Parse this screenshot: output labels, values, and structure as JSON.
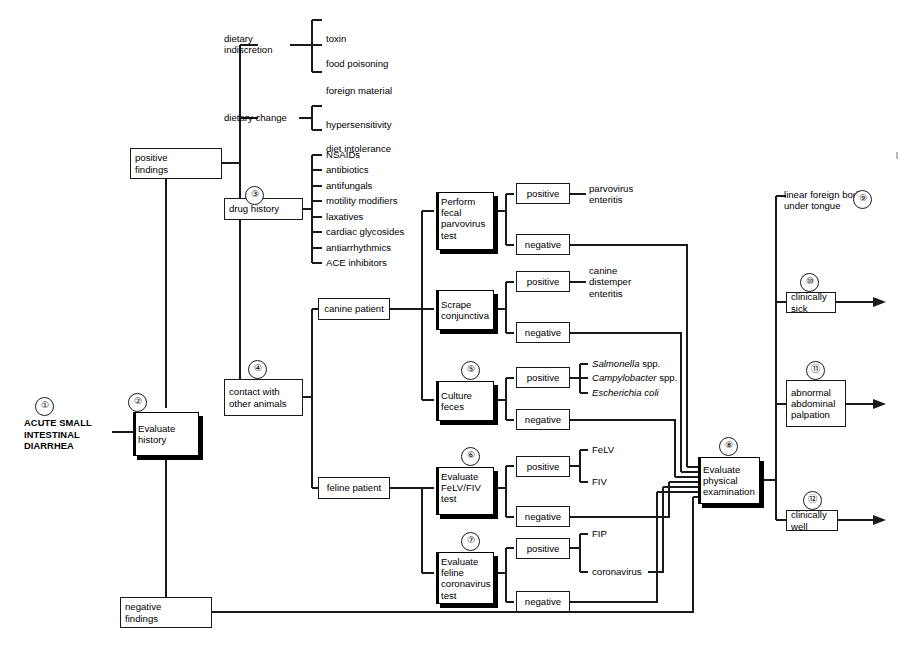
{
  "entry": {
    "label": "ACUTE SMALL\nINTESTINAL\nDIARRHEA",
    "line1": "ACUTE SMALL",
    "line2": "INTESTINAL",
    "line3": "DIARRHEA",
    "number": "①"
  },
  "nodes": {
    "evaluate_history": {
      "label": "Evaluate\nhistory",
      "number": "②"
    },
    "positive_findings": {
      "label": "positive\nfindings"
    },
    "negative_findings": {
      "label": "negative\nfindings"
    },
    "dietary_indiscretion": {
      "label": "dietary\nindiscretion"
    },
    "dietary_change": {
      "label": "dietary change"
    },
    "drug_history": {
      "label": "drug history",
      "number": "③"
    },
    "contact_other_animals": {
      "label": "contact with\nother animals",
      "number": "④"
    },
    "canine_patient": {
      "label": "canine patient"
    },
    "feline_patient": {
      "label": "feline patient"
    },
    "perform_fecal_parvovirus_test": {
      "label": "Perform\nfecal\nparvovirus\ntest"
    },
    "scrape_conjunctiva": {
      "label": "Scrape\nconjunctiva"
    },
    "culture_feces": {
      "label": "Culture\nfeces",
      "number": "⑤"
    },
    "evaluate_felv_fiv_test": {
      "label": "Evaluate\nFeLV/FIV\ntest",
      "number": "⑥"
    },
    "evaluate_feline_coronavirus_test": {
      "label": "Evaluate\nfeline\ncoronavirus\ntest",
      "number": "⑦"
    },
    "evaluate_physical_examination": {
      "label": "Evaluate\nphysical\nexamination",
      "number": "⑧"
    },
    "linear_foreign_body": {
      "label": "linear foreign body\nunder tongue",
      "number": "⑨"
    },
    "clinically_sick": {
      "label": "clinically sick",
      "number": "⑩"
    },
    "abnormal_abdominal_palpation": {
      "label": "abnormal\nabdominal\npalpation",
      "number": "⑪"
    },
    "clinically_well": {
      "label": "clinically well",
      "number": "⑫"
    }
  },
  "results": {
    "positive": "positive",
    "negative": "negative"
  },
  "branch_labels": {
    "parvo_positive": "positive",
    "parvo_negative": "negative",
    "conj_positive": "positive",
    "conj_negative": "negative",
    "culture_positive": "positive",
    "culture_negative": "negative",
    "felv_positive": "positive",
    "felv_negative": "negative",
    "corona_positive": "positive",
    "corona_negative": "negative"
  },
  "leaf_lists": {
    "dietary_indiscretion": [
      "toxin",
      "food poisoning",
      "foreign material"
    ],
    "dietary_change": [
      "hypersensitivity",
      "diet intolerance"
    ],
    "drug_history": [
      "NSAIDs",
      "antibiotics",
      "antifungals",
      "motility modifiers",
      "laxatives",
      "cardiac glycosides",
      "antiarrhythmics",
      "ACE inhibitors"
    ],
    "culture_positive_organisms": [
      {
        "italic": "Salmonella",
        "roman": " spp."
      },
      {
        "italic": "Campylobacter",
        "roman": " spp."
      },
      {
        "italic": "Escherichia coli",
        "roman": ""
      }
    ],
    "felv_positive_results": [
      "FeLV",
      "FIV"
    ],
    "corona_positive_results": [
      "FIP",
      "coronavirus"
    ]
  },
  "diagnoses": {
    "parvovirus_enteritis": {
      "line1": "parvovirus",
      "line2": "enteritis"
    },
    "canine_distemper_enteritis": {
      "line1": "canine",
      "line2": "distemper",
      "line3": "enteritis"
    }
  },
  "colors": {
    "line": "#1a1a1a",
    "text": "#000000",
    "background": "#ffffff",
    "shadow": "#000000"
  }
}
